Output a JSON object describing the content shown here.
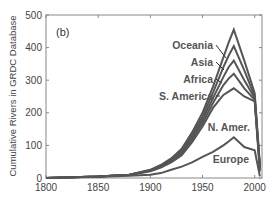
{
  "chart_data": {
    "type": "line",
    "title": "",
    "panel_label": "(b)",
    "xlabel": "",
    "ylabel": "Cumulative Rivers in GRDC Database",
    "xlim": [
      1800,
      2005
    ],
    "ylim": [
      0,
      500
    ],
    "xticks": [
      1800,
      1850,
      1900,
      1950,
      2000
    ],
    "yticks": [
      0,
      100,
      200,
      300,
      400,
      500
    ],
    "grid": false,
    "legend": "inline labels with leader lines",
    "line_color": "#555555",
    "x": [
      1800,
      1850,
      1880,
      1900,
      1910,
      1920,
      1930,
      1940,
      1950,
      1960,
      1970,
      1975,
      1980,
      1990,
      2000,
      2005
    ],
    "series": [
      {
        "name": "Oceania",
        "values": [
          0,
          5,
          10,
          25,
          40,
          60,
          90,
          140,
          200,
          280,
          370,
          415,
          455,
          360,
          260,
          40
        ]
      },
      {
        "name": "Asia",
        "values": [
          0,
          5,
          10,
          24,
          38,
          57,
          85,
          132,
          188,
          262,
          340,
          375,
          405,
          330,
          250,
          35
        ]
      },
      {
        "name": "Africa",
        "values": [
          0,
          5,
          10,
          23,
          36,
          54,
          80,
          125,
          178,
          245,
          310,
          340,
          360,
          300,
          245,
          30
        ]
      },
      {
        "name": "S. America",
        "values": [
          0,
          5,
          10,
          22,
          34,
          51,
          75,
          118,
          168,
          230,
          285,
          305,
          320,
          275,
          240,
          25
        ]
      },
      {
        "name": "N. Amer.",
        "values": [
          0,
          5,
          9,
          21,
          32,
          48,
          70,
          110,
          158,
          215,
          255,
          265,
          275,
          250,
          235,
          20
        ]
      },
      {
        "name": "Europe",
        "values": [
          0,
          4,
          7,
          10,
          15,
          25,
          35,
          48,
          65,
          80,
          100,
          112,
          125,
          95,
          85,
          5
        ]
      }
    ]
  }
}
